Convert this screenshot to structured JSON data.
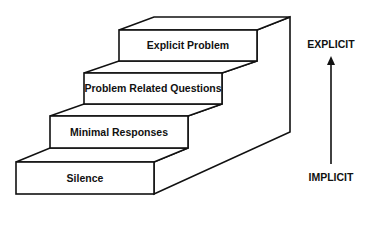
{
  "diagram": {
    "steps": [
      {
        "label": "Explicit Problem"
      },
      {
        "label": "Problem Related Questions"
      },
      {
        "label": "Minimal Responses"
      },
      {
        "label": "Silence"
      }
    ],
    "axis": {
      "top_label": "EXPLICIT",
      "bottom_label": "IMPLICIT",
      "direction": "upward-arrow"
    },
    "colors": {
      "line": "#111111",
      "background": "#ffffff"
    }
  }
}
